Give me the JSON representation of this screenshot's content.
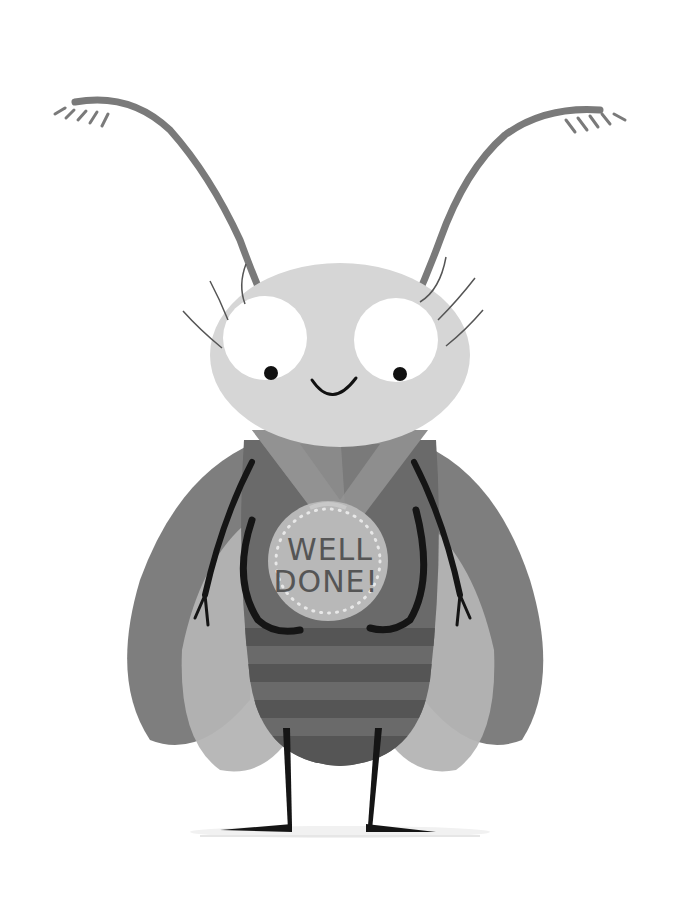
{
  "illustration": {
    "subject": "cartoon fly wearing a medal",
    "medal": {
      "line1": "WELL",
      "line2": "DONE!"
    },
    "colors": {
      "background": "#ffffff",
      "antenna": "#7a7a7a",
      "head": "#d6d6d6",
      "eye_white": "#ffffff",
      "pupil": "#111111",
      "outer_wing": "#7e7e7e",
      "inner_wing": "#b4b4b4",
      "body": "#6a6a6a",
      "body_stripe": "#555555",
      "ribbon": "#8e8e8e",
      "medal": "#b8b8b8",
      "limbs": "#151515"
    }
  }
}
